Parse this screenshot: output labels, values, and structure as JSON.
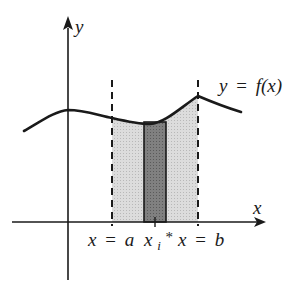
{
  "diagram": {
    "type": "riemann-sum-area-under-curve",
    "axes": {
      "x_label": "x",
      "y_label": "y"
    },
    "curve": {
      "label_y": "y",
      "label_eq": "=",
      "label_f": "f(x)"
    },
    "bounds": {
      "left_label": "x = a",
      "left_var": "x",
      "left_eq": "=",
      "left_val": "a",
      "right_var": "x",
      "right_eq": "=",
      "right_val": "b"
    },
    "sample_point": {
      "base": "x",
      "subscript": "i",
      "superscript": "*"
    },
    "colors": {
      "line": "#1a1a1a",
      "region_fill": "#d4d4d4",
      "strip_fill": "#7a7a7a",
      "background": "#ffffff"
    }
  }
}
